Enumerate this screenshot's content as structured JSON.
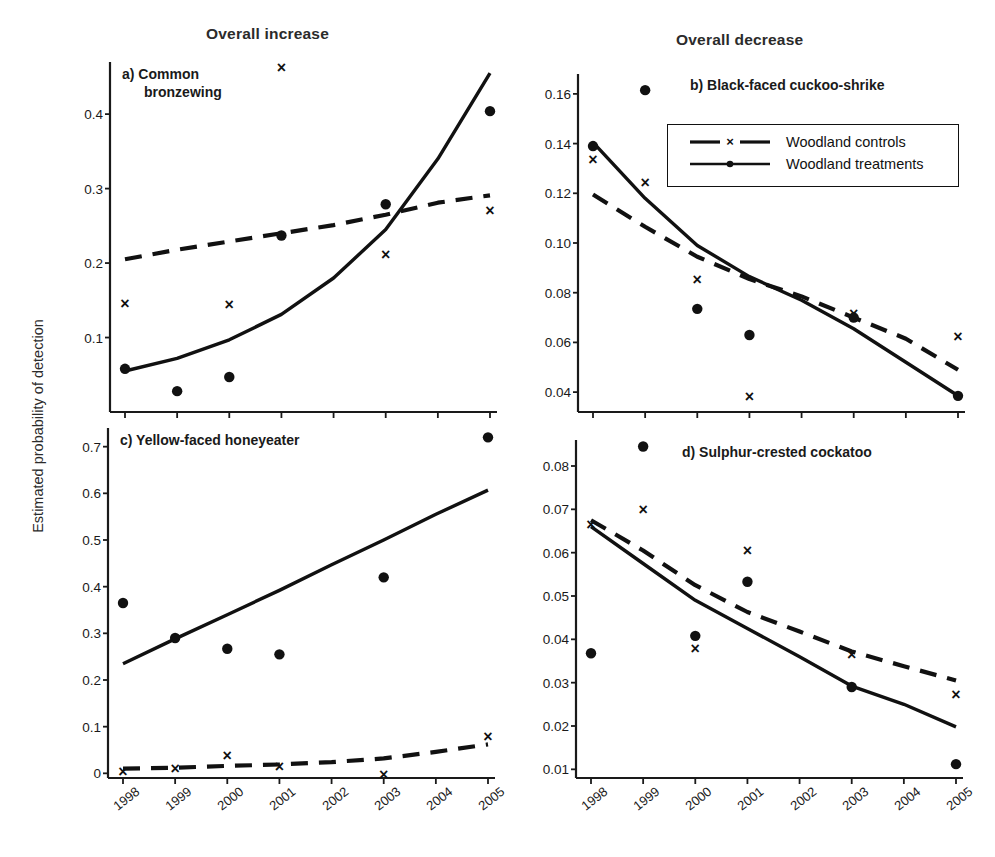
{
  "figure": {
    "ylabel": "Estimated probability of detection",
    "column_titles": {
      "left": "Overall increase",
      "right": "Overall decrease"
    },
    "legend": {
      "entries": [
        {
          "label": "Woodland controls",
          "style": "dashed",
          "marker": "x"
        },
        {
          "label": "Woodland treatments",
          "style": "solid",
          "marker": "dot"
        }
      ]
    }
  },
  "chart_data": [
    {
      "type": "scatter",
      "panel": "a",
      "title": "a) Common\nbronzewing",
      "title_lines": [
        "a) Common",
        "bronzewing"
      ],
      "xlabel": "",
      "ylabel": "Estimated probability of detection",
      "x": [
        1998,
        1999,
        2000,
        2001,
        2002,
        2003,
        2004,
        2005
      ],
      "xtick_labels": [
        "1998",
        "1999",
        "2000",
        "2001",
        "2002",
        "2003",
        "2004",
        "2005"
      ],
      "ytick_labels": [
        "0.1",
        "0.2",
        "0.3",
        "0.4"
      ],
      "yticks": [
        0.1,
        0.2,
        0.3,
        0.4
      ],
      "ylim": [
        0.0,
        0.47
      ],
      "grid": false,
      "series": [
        {
          "name": "Woodland controls",
          "marker": "x",
          "style": "dashed",
          "points": [
            {
              "x": 1998,
              "y": 0.146
            },
            {
              "x": 2000,
              "y": 0.145
            },
            {
              "x": 2001,
              "y": 0.462
            },
            {
              "x": 2003,
              "y": 0.211
            },
            {
              "x": 2005,
              "y": 0.271
            }
          ],
          "fit_line": [
            {
              "x": 1998,
              "y": 0.205
            },
            {
              "x": 1999,
              "y": 0.218
            },
            {
              "x": 2000,
              "y": 0.229
            },
            {
              "x": 2001,
              "y": 0.24
            },
            {
              "x": 2002,
              "y": 0.251
            },
            {
              "x": 2003,
              "y": 0.265
            },
            {
              "x": 2004,
              "y": 0.281
            },
            {
              "x": 2005,
              "y": 0.291
            }
          ]
        },
        {
          "name": "Woodland treatments",
          "marker": "dot",
          "style": "solid",
          "points": [
            {
              "x": 1998,
              "y": 0.058
            },
            {
              "x": 1999,
              "y": 0.028
            },
            {
              "x": 2000,
              "y": 0.047
            },
            {
              "x": 2001,
              "y": 0.237
            },
            {
              "x": 2003,
              "y": 0.279
            },
            {
              "x": 2005,
              "y": 0.404
            }
          ],
          "fit_line": [
            {
              "x": 1998,
              "y": 0.055
            },
            {
              "x": 1999,
              "y": 0.072
            },
            {
              "x": 2000,
              "y": 0.097
            },
            {
              "x": 2001,
              "y": 0.131
            },
            {
              "x": 2002,
              "y": 0.18
            },
            {
              "x": 2003,
              "y": 0.245
            },
            {
              "x": 2004,
              "y": 0.34
            },
            {
              "x": 2005,
              "y": 0.455
            }
          ]
        }
      ]
    },
    {
      "type": "scatter",
      "panel": "b",
      "title": "b) Black-faced cuckoo-shrike",
      "title_lines": [
        "b) Black-faced cuckoo-shrike"
      ],
      "xlabel": "",
      "ylabel": "Estimated probability of detection",
      "x": [
        1998,
        1999,
        2000,
        2001,
        2002,
        2003,
        2004,
        2005
      ],
      "xtick_labels": [
        "1998",
        "1999",
        "2000",
        "2001",
        "2002",
        "2003",
        "2004",
        "2005"
      ],
      "ytick_labels": [
        "0.04",
        "0.06",
        "0.08",
        "0.10",
        "0.12",
        "0.14",
        "0.16"
      ],
      "yticks": [
        0.04,
        0.06,
        0.08,
        0.1,
        0.12,
        0.14,
        0.16
      ],
      "ylim": [
        0.032,
        0.168
      ],
      "grid": false,
      "series": [
        {
          "name": "Woodland controls",
          "marker": "x",
          "style": "dashed",
          "points": [
            {
              "x": 1998,
              "y": 0.1335
            },
            {
              "x": 1999,
              "y": 0.1245
            },
            {
              "x": 2000,
              "y": 0.0852
            },
            {
              "x": 2001,
              "y": 0.0382
            },
            {
              "x": 2003,
              "y": 0.0718
            },
            {
              "x": 2005,
              "y": 0.0622
            }
          ],
          "fit_line": [
            {
              "x": 1998,
              "y": 0.1195
            },
            {
              "x": 1999,
              "y": 0.1065
            },
            {
              "x": 2000,
              "y": 0.0945
            },
            {
              "x": 2001,
              "y": 0.0855
            },
            {
              "x": 2002,
              "y": 0.0785
            },
            {
              "x": 2003,
              "y": 0.07
            },
            {
              "x": 2004,
              "y": 0.0615
            },
            {
              "x": 2005,
              "y": 0.049
            }
          ]
        },
        {
          "name": "Woodland treatments",
          "marker": "dot",
          "style": "solid",
          "points": [
            {
              "x": 1998,
              "y": 0.139
            },
            {
              "x": 1999,
              "y": 0.1615
            },
            {
              "x": 2000,
              "y": 0.0735
            },
            {
              "x": 2001,
              "y": 0.063
            },
            {
              "x": 2003,
              "y": 0.07
            },
            {
              "x": 2005,
              "y": 0.0385
            }
          ],
          "fit_line": [
            {
              "x": 1998,
              "y": 0.1405
            },
            {
              "x": 1999,
              "y": 0.118
            },
            {
              "x": 2000,
              "y": 0.099
            },
            {
              "x": 2001,
              "y": 0.0865
            },
            {
              "x": 2002,
              "y": 0.077
            },
            {
              "x": 2003,
              "y": 0.0655
            },
            {
              "x": 2004,
              "y": 0.052
            },
            {
              "x": 2005,
              "y": 0.0385
            }
          ]
        }
      ]
    },
    {
      "type": "scatter",
      "panel": "c",
      "title": "c) Yellow-faced honeyeater",
      "title_lines": [
        "c) Yellow-faced honeyeater"
      ],
      "xlabel": "",
      "ylabel": "Estimated probability of detection",
      "x": [
        1998,
        1999,
        2000,
        2001,
        2002,
        2003,
        2004,
        2005
      ],
      "xtick_labels": [
        "1998",
        "1999",
        "2000",
        "2001",
        "2002",
        "2003",
        "2004",
        "2005"
      ],
      "ytick_labels": [
        "0",
        "0.1",
        "0.2",
        "0.3",
        "0.4",
        "0.5",
        "0.6",
        "0.7"
      ],
      "yticks": [
        0,
        0.1,
        0.2,
        0.3,
        0.4,
        0.5,
        0.6,
        0.7
      ],
      "ylim": [
        -0.01,
        0.74
      ],
      "grid": false,
      "series": [
        {
          "name": "Woodland controls",
          "marker": "x",
          "style": "dashed",
          "points": [
            {
              "x": 1998,
              "y": 0.004
            },
            {
              "x": 1999,
              "y": 0.01
            },
            {
              "x": 2000,
              "y": 0.038
            },
            {
              "x": 2001,
              "y": 0.015
            },
            {
              "x": 2003,
              "y": -0.002
            },
            {
              "x": 2005,
              "y": 0.08
            }
          ],
          "fit_line": [
            {
              "x": 1998,
              "y": 0.01
            },
            {
              "x": 1999,
              "y": 0.012
            },
            {
              "x": 2000,
              "y": 0.016
            },
            {
              "x": 2001,
              "y": 0.019
            },
            {
              "x": 2002,
              "y": 0.024
            },
            {
              "x": 2003,
              "y": 0.032
            },
            {
              "x": 2004,
              "y": 0.046
            },
            {
              "x": 2005,
              "y": 0.062
            }
          ]
        },
        {
          "name": "Woodland treatments",
          "marker": "dot",
          "style": "solid",
          "points": [
            {
              "x": 1998,
              "y": 0.365
            },
            {
              "x": 1999,
              "y": 0.29
            },
            {
              "x": 2000,
              "y": 0.267
            },
            {
              "x": 2001,
              "y": 0.255
            },
            {
              "x": 2003,
              "y": 0.42
            },
            {
              "x": 2005,
              "y": 0.72
            }
          ],
          "fit_line": [
            {
              "x": 1998,
              "y": 0.235
            },
            {
              "x": 1999,
              "y": 0.288
            },
            {
              "x": 2000,
              "y": 0.34
            },
            {
              "x": 2001,
              "y": 0.392
            },
            {
              "x": 2002,
              "y": 0.447
            },
            {
              "x": 2003,
              "y": 0.5
            },
            {
              "x": 2004,
              "y": 0.555
            },
            {
              "x": 2005,
              "y": 0.607
            }
          ]
        }
      ]
    },
    {
      "type": "scatter",
      "panel": "d",
      "title": "d) Sulphur-crested cockatoo",
      "title_lines": [
        "d) Sulphur-crested cockatoo"
      ],
      "xlabel": "",
      "ylabel": "Estimated probability of detection",
      "x": [
        1998,
        1999,
        2000,
        2001,
        2002,
        2003,
        2004,
        2005
      ],
      "xtick_labels": [
        "1998",
        "1999",
        "2000",
        "2001",
        "2002",
        "2003",
        "2004",
        "2005"
      ],
      "ytick_labels": [
        "0.01",
        "0.02",
        "0.03",
        "0.04",
        "0.05",
        "0.06",
        "0.07",
        "0.08"
      ],
      "yticks": [
        0.01,
        0.02,
        0.03,
        0.04,
        0.05,
        0.06,
        0.07,
        0.08
      ],
      "ylim": [
        0.008,
        0.086
      ],
      "grid": false,
      "series": [
        {
          "name": "Woodland controls",
          "marker": "x",
          "style": "dashed",
          "points": [
            {
              "x": 1998,
              "y": 0.0665
            },
            {
              "x": 1999,
              "y": 0.07
            },
            {
              "x": 2000,
              "y": 0.038
            },
            {
              "x": 2001,
              "y": 0.0605
            },
            {
              "x": 2003,
              "y": 0.0365
            },
            {
              "x": 2005,
              "y": 0.0272
            }
          ],
          "fit_line": [
            {
              "x": 1998,
              "y": 0.0675
            },
            {
              "x": 1999,
              "y": 0.0605
            },
            {
              "x": 2000,
              "y": 0.0525
            },
            {
              "x": 2001,
              "y": 0.0463
            },
            {
              "x": 2002,
              "y": 0.0418
            },
            {
              "x": 2003,
              "y": 0.0372
            },
            {
              "x": 2004,
              "y": 0.0338
            },
            {
              "x": 2005,
              "y": 0.0305
            }
          ]
        },
        {
          "name": "Woodland treatments",
          "marker": "dot",
          "style": "solid",
          "points": [
            {
              "x": 1998,
              "y": 0.0368
            },
            {
              "x": 1999,
              "y": 0.0845
            },
            {
              "x": 2000,
              "y": 0.0408
            },
            {
              "x": 2001,
              "y": 0.0533
            },
            {
              "x": 2003,
              "y": 0.029
            },
            {
              "x": 2005,
              "y": 0.0112
            }
          ],
          "fit_line": [
            {
              "x": 1998,
              "y": 0.066
            },
            {
              "x": 1999,
              "y": 0.0575
            },
            {
              "x": 2000,
              "y": 0.049
            },
            {
              "x": 2001,
              "y": 0.0425
            },
            {
              "x": 2002,
              "y": 0.036
            },
            {
              "x": 2003,
              "y": 0.0292
            },
            {
              "x": 2004,
              "y": 0.025
            },
            {
              "x": 2005,
              "y": 0.0198
            }
          ]
        }
      ]
    }
  ]
}
